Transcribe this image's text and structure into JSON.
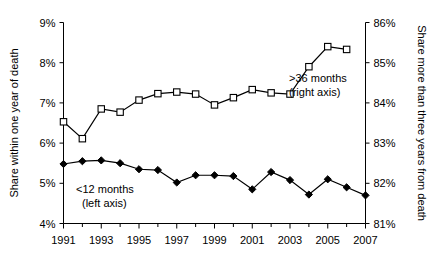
{
  "chart_data": {
    "type": "line",
    "title": "",
    "xlabel": "",
    "x": [
      1991,
      1992,
      1993,
      1994,
      1995,
      1996,
      1997,
      1998,
      1999,
      2000,
      2001,
      2002,
      2003,
      2004,
      2005,
      2006,
      2007
    ],
    "xticklabels": [
      "1991",
      "1993",
      "1995",
      "1997",
      "1999",
      "2001",
      "2003",
      "2005",
      "2007"
    ],
    "xtickyears": [
      1991,
      1993,
      1995,
      1997,
      1999,
      2001,
      2003,
      2005,
      2007
    ],
    "xlim": [
      1991,
      2007
    ],
    "grid": false,
    "legend_position": "inline-annotations",
    "left_axis": {
      "label": "Share within one year of death",
      "ticklabels": [
        "9%",
        "8%",
        "7%",
        "6%",
        "5%",
        "4%"
      ],
      "tickvalues": [
        9,
        8,
        7,
        6,
        5,
        4
      ],
      "ylim": [
        4,
        9
      ]
    },
    "right_axis": {
      "label": "Share more than three years from death",
      "ticklabels": [
        "86%",
        "85%",
        "84%",
        "83%",
        "82%",
        "81%"
      ],
      "tickvalues": [
        86,
        85,
        84,
        83,
        82,
        81
      ],
      "ylim": [
        81,
        86
      ]
    },
    "series": [
      {
        "name": ">36 months",
        "axis": "right",
        "marker": "open-square",
        "annotation_line1": ">36 months",
        "annotation_line2": "(right axis)",
        "x": [
          1991,
          1992,
          1993,
          1994,
          1995,
          1996,
          1997,
          1998,
          1999,
          2000,
          2001,
          2002,
          2003,
          2004,
          2005,
          2006
        ],
        "values": [
          83.53,
          83.11,
          83.85,
          83.77,
          84.07,
          84.23,
          84.27,
          84.22,
          83.95,
          84.13,
          84.33,
          84.25,
          84.22,
          84.9,
          85.4,
          85.33
        ]
      },
      {
        "name": "<12 months",
        "axis": "left",
        "marker": "filled-diamond",
        "annotation_line1": "<12 months",
        "annotation_line2": "(left axis)",
        "x": [
          1991,
          1992,
          1993,
          1994,
          1995,
          1996,
          1997,
          1998,
          1999,
          2000,
          2001,
          2002,
          2003,
          2004,
          2005,
          2006,
          2007
        ],
        "values": [
          5.48,
          5.55,
          5.57,
          5.5,
          5.35,
          5.33,
          5.02,
          5.2,
          5.2,
          5.18,
          4.85,
          5.28,
          5.08,
          4.72,
          5.1,
          4.9,
          4.7
        ]
      }
    ]
  }
}
